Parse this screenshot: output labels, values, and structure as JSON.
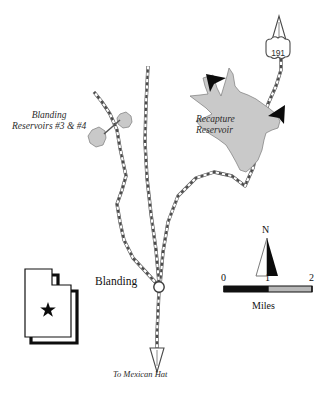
{
  "map": {
    "title_labels": {
      "blanding_reservoirs": "Blanding",
      "blanding_reservoirs_line2": "Reservoirs #3 & #4",
      "recapture_reservoir": "Recapture",
      "recapture_reservoir_line2": "Reservoir",
      "city": "Blanding",
      "destination": "To Mexican Hat"
    },
    "highway_shield": {
      "number": "191",
      "type": "us-highway-shield"
    },
    "north_arrow": {
      "letter": "N"
    },
    "scale_bar": {
      "ticks": [
        "0",
        "1",
        "2"
      ],
      "unit_label": "Miles"
    },
    "inset": {
      "state": "Utah",
      "marker": "star"
    },
    "colors": {
      "water_fill": "#c9c9c9",
      "water_stroke": "#6f6f6f",
      "road_casing": "#4a4a4a",
      "road_dash": "#555555",
      "ink": "#111111",
      "shadow": "#000000",
      "background": "#ffffff"
    },
    "features": {
      "reservoirs": [
        "Blanding Reservoir #3",
        "Blanding Reservoir #4",
        "Recapture Reservoir"
      ],
      "roads": [
        "US 191 north",
        "county road west",
        "county road east",
        "US 191 south"
      ],
      "pointer_arrows": 2
    }
  }
}
